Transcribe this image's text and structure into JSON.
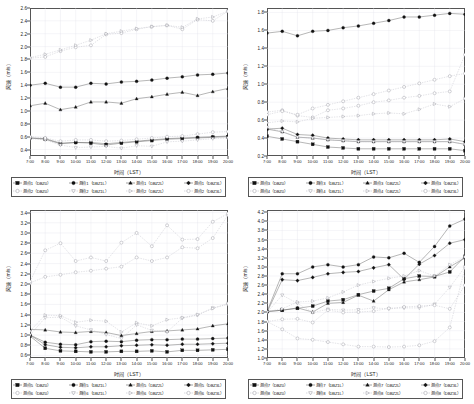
{
  "figure": {
    "axis_labels": {
      "x": "时间（LST）",
      "y": "风速（m/s）"
    }
  },
  "x_ticks": [
    "7:00",
    "8:00",
    "9:00",
    "10:00",
    "11:00",
    "12:00",
    "13:00",
    "14:00",
    "15:00",
    "16:00",
    "17:00",
    "18:00",
    "19:00",
    "20:00"
  ],
  "markers": {
    "filled_square": "filled-square-marker",
    "filled_circle": "filled-circle-marker",
    "filled_triangle_up": "filled-triangle-up-marker",
    "filled_diamond": "filled-diamond-marker",
    "open_circle": "open-circle-marker",
    "open_triangle_down": "open-triangle-down-marker",
    "open_triangle_right": "open-triangle-right-marker",
    "open_circle2": "open-circle-marker"
  },
  "chart_data": [
    {
      "type": "line",
      "panel": "top-left",
      "title": "",
      "xlabel": "时间（LST）",
      "ylabel": "风速（m/s）",
      "x": [
        "7:00",
        "8:00",
        "9:00",
        "10:00",
        "11:00",
        "12:00",
        "13:00",
        "14:00",
        "15:00",
        "16:00",
        "17:00",
        "18:00",
        "19:00",
        "20:00"
      ],
      "ylim": [
        0.3,
        2.6
      ],
      "yticks": [
        0.4,
        0.6,
        0.8,
        1.0,
        1.2,
        1.4,
        1.6,
        1.8,
        2.0,
        2.2,
        2.4,
        2.6
      ],
      "grid": true,
      "legend_position": "below",
      "series": [
        {
          "name": "测点1（DBZ0）",
          "marker": "filled_square",
          "values": [
            0.58,
            0.56,
            0.49,
            0.51,
            0.5,
            0.47,
            0.5,
            0.52,
            0.54,
            0.56,
            0.57,
            0.58,
            0.59,
            0.6
          ]
        },
        {
          "name": "测点1（DBZ1L）",
          "marker": "filled_circle",
          "values": [
            1.4,
            1.43,
            1.37,
            1.37,
            1.43,
            1.42,
            1.45,
            1.46,
            1.48,
            1.51,
            1.53,
            1.56,
            1.57,
            1.59
          ]
        },
        {
          "name": "测点1（DBZ2L）",
          "marker": "filled_triangle_up",
          "values": [
            1.08,
            1.12,
            1.02,
            1.06,
            1.14,
            1.14,
            1.12,
            1.19,
            1.22,
            1.26,
            1.29,
            1.24,
            1.3,
            1.35
          ]
        },
        {
          "name": "测点1（DBZ3L）",
          "marker": "filled_diamond",
          "values": [
            0.58,
            0.57,
            0.5,
            0.51,
            0.51,
            0.49,
            0.51,
            0.53,
            0.55,
            0.57,
            0.58,
            0.59,
            0.6,
            0.61
          ]
        },
        {
          "name": "测点2（DBZ0）",
          "marker": "open_circle",
          "values": [
            1.82,
            1.84,
            1.93,
            1.99,
            2.02,
            2.19,
            2.21,
            2.27,
            2.31,
            2.33,
            2.27,
            2.42,
            2.4,
            2.55
          ]
        },
        {
          "name": "测点2（DBZ1L）",
          "marker": "open_triangle_down",
          "values": [
            0.57,
            0.55,
            0.47,
            0.43,
            0.44,
            0.45,
            0.42,
            0.46,
            0.45,
            0.52,
            0.53,
            0.55,
            0.57,
            0.58
          ]
        },
        {
          "name": "测点2（DBZ2L）",
          "marker": "open_triangle_right",
          "values": [
            1.83,
            1.88,
            1.95,
            2.02,
            2.1,
            2.2,
            2.24,
            2.28,
            2.31,
            2.33,
            2.3,
            2.43,
            2.46,
            2.55
          ]
        },
        {
          "name": "测点2（DBZ3L）",
          "marker": "open_circle2",
          "values": [
            0.6,
            0.58,
            0.53,
            0.55,
            0.55,
            0.53,
            0.54,
            0.56,
            0.58,
            0.6,
            0.61,
            0.64,
            0.67,
            0.68
          ]
        }
      ]
    },
    {
      "type": "line",
      "panel": "top-right",
      "title": "",
      "xlabel": "时间（LST）",
      "ylabel": "风速（m/s）",
      "x": [
        "7:00",
        "8:00",
        "9:00",
        "10:00",
        "11:00",
        "12:00",
        "13:00",
        "14:00",
        "15:00",
        "16:00",
        "17:00",
        "18:00",
        "19:00",
        "20:00"
      ],
      "ylim": [
        0.2,
        1.85
      ],
      "yticks": [
        0.2,
        0.4,
        0.6,
        0.8,
        1.0,
        1.2,
        1.4,
        1.6,
        1.8
      ],
      "grid": true,
      "legend_position": "below",
      "series": [
        {
          "name": "测点3（DBZ0）",
          "marker": "filled_square",
          "values": [
            0.42,
            0.39,
            0.36,
            0.33,
            0.3,
            0.29,
            0.28,
            0.28,
            0.28,
            0.28,
            0.28,
            0.28,
            0.28,
            0.26
          ]
        },
        {
          "name": "测点3（DBZ1L）",
          "marker": "filled_circle",
          "values": [
            1.57,
            1.59,
            1.54,
            1.59,
            1.6,
            1.63,
            1.65,
            1.68,
            1.71,
            1.75,
            1.75,
            1.77,
            1.79,
            1.78
          ]
        },
        {
          "name": "测点3（DBZ2L）",
          "marker": "filled_triangle_up",
          "values": [
            0.5,
            0.47,
            0.41,
            0.4,
            0.38,
            0.37,
            0.36,
            0.36,
            0.36,
            0.36,
            0.36,
            0.36,
            0.36,
            0.33
          ]
        },
        {
          "name": "测点3（DBZ3L）",
          "marker": "filled_diamond",
          "values": [
            0.5,
            0.51,
            0.44,
            0.43,
            0.4,
            0.39,
            0.38,
            0.38,
            0.38,
            0.38,
            0.38,
            0.38,
            0.39,
            0.36
          ]
        },
        {
          "name": "测点4（DBZ0）",
          "marker": "open_circle",
          "values": [
            0.69,
            0.71,
            0.65,
            0.63,
            0.71,
            0.73,
            0.76,
            0.8,
            0.82,
            0.85,
            0.87,
            0.9,
            0.92,
            1.33
          ]
        },
        {
          "name": "测点4（DBZ1L）",
          "marker": "open_triangle_down",
          "values": [
            0.52,
            0.47,
            0.41,
            0.4,
            0.38,
            0.37,
            0.36,
            0.36,
            0.36,
            0.36,
            0.36,
            0.36,
            0.36,
            0.33
          ]
        },
        {
          "name": "测点4（DBZ2L）",
          "marker": "open_triangle_right",
          "values": [
            0.57,
            0.59,
            0.58,
            0.62,
            0.63,
            0.64,
            0.65,
            0.67,
            0.68,
            0.67,
            0.72,
            0.78,
            0.75,
            0.84
          ]
        },
        {
          "name": "测点4（DBZ3L）",
          "marker": "open_circle2",
          "values": [
            0.66,
            0.7,
            0.66,
            0.73,
            0.77,
            0.81,
            0.85,
            0.89,
            0.93,
            0.97,
            1.01,
            1.05,
            1.09,
            1.12
          ]
        }
      ]
    },
    {
      "type": "line",
      "panel": "bottom-left",
      "title": "",
      "xlabel": "时间（LST）",
      "ylabel": "风速（m/s）",
      "x": [
        "7:00",
        "8:00",
        "9:00",
        "10:00",
        "11:00",
        "12:00",
        "13:00",
        "14:00",
        "15:00",
        "16:00",
        "17:00",
        "18:00",
        "19:00",
        "20:00"
      ],
      "ylim": [
        0.55,
        3.45
      ],
      "yticks": [
        0.6,
        0.8,
        1.0,
        1.2,
        1.4,
        1.6,
        1.8,
        2.0,
        2.2,
        2.4,
        2.6,
        2.8,
        3.0,
        3.2,
        3.4
      ],
      "grid": true,
      "legend_position": "below",
      "series": [
        {
          "name": "测点5（DBZ0）",
          "marker": "filled_square",
          "values": [
            0.98,
            0.74,
            0.69,
            0.68,
            0.67,
            0.67,
            0.68,
            0.68,
            0.69,
            0.67,
            0.7,
            0.7,
            0.71,
            0.72
          ]
        },
        {
          "name": "测点5（DBZ1L）",
          "marker": "filled_circle",
          "values": [
            1.0,
            0.86,
            0.82,
            0.81,
            0.87,
            0.88,
            0.87,
            0.9,
            0.91,
            0.91,
            0.92,
            0.92,
            0.93,
            0.94
          ]
        },
        {
          "name": "测点5（DBZ2L）",
          "marker": "filled_triangle_up",
          "values": [
            1.11,
            1.1,
            1.06,
            1.05,
            1.07,
            1.05,
            0.99,
            1.03,
            1.07,
            1.08,
            1.1,
            1.12,
            1.18,
            1.22
          ]
        },
        {
          "name": "测点5（DBZ3L）",
          "marker": "filled_diamond",
          "values": [
            1.0,
            0.81,
            0.76,
            0.75,
            0.77,
            0.77,
            0.79,
            0.8,
            0.81,
            0.8,
            0.82,
            0.82,
            0.83,
            0.84
          ]
        },
        {
          "name": "测点6（DBZ0）",
          "marker": "open_circle",
          "values": [
            2.02,
            2.14,
            2.18,
            2.23,
            2.26,
            2.3,
            2.34,
            2.52,
            2.45,
            2.52,
            2.72,
            2.7,
            2.9,
            3.35
          ]
        },
        {
          "name": "测点6（DBZ1L）",
          "marker": "open_triangle_down",
          "values": [
            1.0,
            1.34,
            1.35,
            1.18,
            1.1,
            1.01,
            0.93,
            1.2,
            1.09,
            1.06,
            1.33,
            1.39,
            1.53,
            1.6
          ]
        },
        {
          "name": "测点6（DBZ2L）",
          "marker": "open_triangle_right",
          "values": [
            1.08,
            1.39,
            1.38,
            1.25,
            1.29,
            1.27,
            1.06,
            1.24,
            1.18,
            1.3,
            1.34,
            1.4,
            1.52,
            1.62
          ]
        },
        {
          "name": "测点6（DBZ3L）",
          "marker": "open_circle2",
          "values": [
            2.05,
            2.66,
            2.8,
            2.45,
            2.52,
            2.45,
            2.81,
            3.0,
            2.74,
            3.15,
            2.87,
            2.88,
            3.22,
            3.38
          ]
        }
      ]
    },
    {
      "type": "line",
      "panel": "bottom-right",
      "title": "",
      "xlabel": "时间（LST）",
      "ylabel": "风速（m/s）",
      "x": [
        "7:00",
        "8:00",
        "9:00",
        "10:00",
        "11:00",
        "12:00",
        "13:00",
        "14:00",
        "15:00",
        "16:00",
        "17:00",
        "18:00",
        "19:00",
        "20:00"
      ],
      "ylim": [
        1.0,
        4.25
      ],
      "yticks": [
        1.0,
        1.2,
        1.4,
        1.6,
        1.8,
        2.0,
        2.2,
        2.4,
        2.6,
        2.8,
        3.0,
        3.2,
        3.4,
        3.6,
        3.8,
        4.0,
        4.2
      ],
      "grid": true,
      "legend_position": "below",
      "series": [
        {
          "name": "测点7（DBZ0）",
          "marker": "filled_square",
          "values": [
            2.02,
            2.05,
            2.09,
            2.14,
            2.25,
            2.28,
            2.39,
            2.47,
            2.53,
            2.74,
            2.8,
            2.79,
            2.89,
            3.23
          ]
        },
        {
          "name": "测点7（DBZ1L）",
          "marker": "filled_circle",
          "values": [
            2.02,
            2.85,
            2.85,
            3.0,
            3.05,
            3.0,
            3.05,
            3.22,
            3.2,
            3.3,
            3.1,
            3.45,
            3.9,
            4.05
          ]
        },
        {
          "name": "测点7（DBZ2L）",
          "marker": "filled_triangle_up",
          "values": [
            2.02,
            2.05,
            2.1,
            2.01,
            2.2,
            2.22,
            2.38,
            2.25,
            2.5,
            2.67,
            2.72,
            2.78,
            3.0,
            3.2
          ]
        },
        {
          "name": "测点7（DBZ3L）",
          "marker": "filled_diamond",
          "values": [
            2.0,
            2.72,
            2.7,
            2.77,
            2.85,
            2.88,
            2.9,
            2.98,
            3.05,
            2.73,
            3.06,
            3.25,
            3.52,
            3.6
          ]
        },
        {
          "name": "测点8（DBZ0）",
          "marker": "open_circle",
          "values": [
            1.8,
            1.63,
            1.43,
            1.4,
            1.35,
            1.3,
            1.25,
            1.25,
            1.24,
            1.25,
            1.28,
            1.37,
            1.67,
            2.98
          ]
        },
        {
          "name": "测点8（DBZ1L）",
          "marker": "open_triangle_down",
          "values": [
            2.0,
            2.38,
            2.2,
            2.0,
            2.07,
            2.05,
            2.06,
            2.1,
            2.08,
            2.1,
            2.1,
            2.18,
            2.55,
            3.0
          ]
        },
        {
          "name": "测点8（DBZ2L）",
          "marker": "open_triangle_right",
          "values": [
            2.02,
            2.08,
            2.23,
            2.25,
            2.32,
            2.45,
            2.6,
            2.68,
            2.75,
            2.8,
            2.92,
            2.8,
            3.05,
            3.22
          ]
        },
        {
          "name": "测点8（DBZ3L）",
          "marker": "open_circle2",
          "values": [
            1.8,
            1.85,
            1.86,
            1.78,
            2.05,
            2.0,
            2.01,
            2.03,
            2.09,
            2.12,
            2.14,
            2.16,
            2.08,
            2.6
          ]
        }
      ]
    }
  ]
}
